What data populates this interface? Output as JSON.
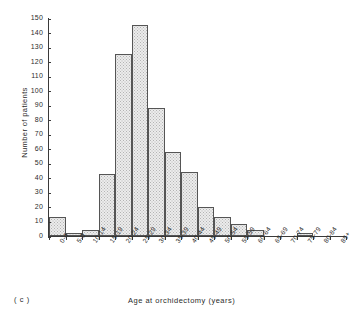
{
  "chart_data": {
    "type": "bar",
    "title": "",
    "subtitle": "",
    "xlabel": "Age at orchidectomy (years)",
    "ylabel": "Number of patients",
    "panel_label": "( c )",
    "grid": false,
    "legend": null,
    "ylim": [
      0,
      150
    ],
    "ytick_step": 10,
    "yticks": [
      0,
      10,
      20,
      30,
      40,
      50,
      60,
      70,
      80,
      90,
      100,
      110,
      120,
      130,
      140,
      150
    ],
    "categories": [
      "0-4",
      "5-9",
      "10-14",
      "15-19",
      "20-24",
      "25-29",
      "30-34",
      "35-39",
      "40-44",
      "45-49",
      "50-54",
      "55-59",
      "60-64",
      "65-69",
      "70-74",
      "75-79",
      "80-84",
      "85+"
    ],
    "values": [
      13,
      2,
      4,
      43,
      125,
      145,
      88,
      58,
      44,
      20,
      13,
      8,
      4,
      0,
      0,
      2,
      0,
      0
    ],
    "bar_fill": "#ececec",
    "bar_edge": "#555555",
    "axis_color": "#3a3a3a"
  }
}
